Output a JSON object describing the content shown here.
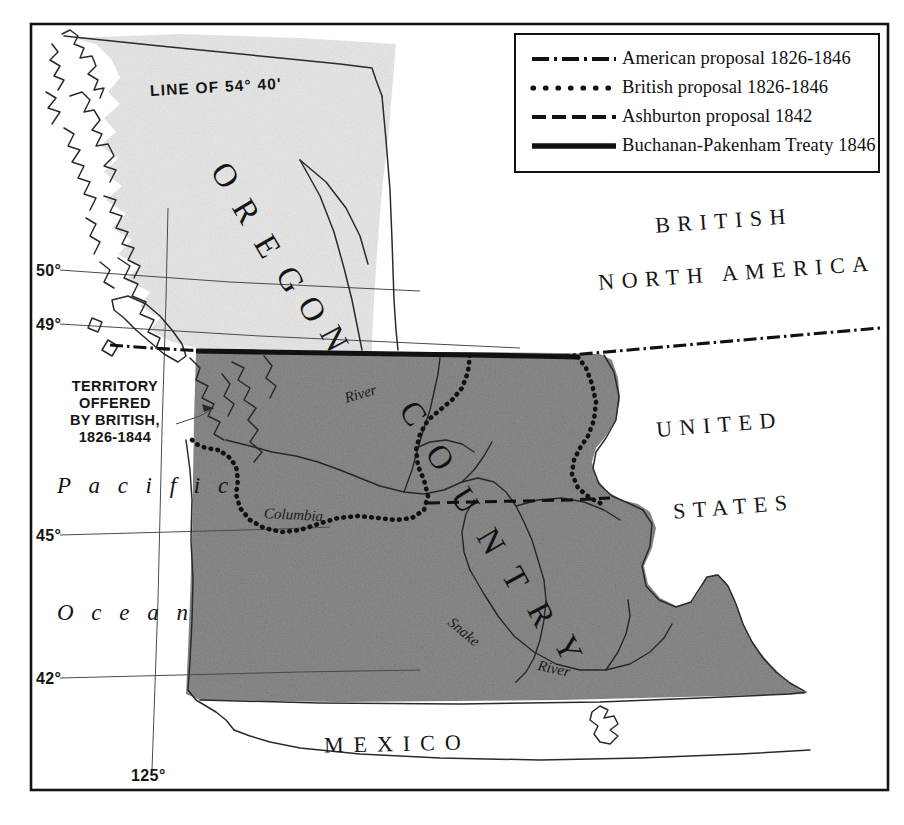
{
  "map": {
    "title_region": "Oregon Country boundary dispute map",
    "legend": {
      "entries": [
        {
          "style": "dash-dot",
          "label": "American proposal 1826-1846"
        },
        {
          "style": "dotted",
          "label": "British proposal 1826-1846"
        },
        {
          "style": "dashed",
          "label": "Ashburton proposal 1842"
        },
        {
          "style": "solid",
          "label": "Buchanan-Pakenham Treaty 1846"
        }
      ]
    },
    "labels": {
      "line_of_5440": "LINE OF 54° 40'",
      "territory_offered": "TERRITORY\nOFFERED\nBY BRITISH,\n1826-1844",
      "territory_offered_lines": [
        "TERRITORY",
        "OFFERED",
        "BY BRITISH,",
        "1826-1844"
      ],
      "pacific": "P a c i f i c",
      "ocean": "O c e a n",
      "british": "BRITISH",
      "north_america": "NORTH AMERICA",
      "united": "UNITED",
      "states": "STATES",
      "mexico": "MEXICO",
      "oregon": "OREGON",
      "country": "COUNTRY",
      "columbia_river_name": "Columbia",
      "columbia_river_word2": "River",
      "snake_river_name": "Snake",
      "snake_river_word2": "River"
    },
    "graticule": {
      "latitudes": [
        "50°",
        "49°",
        "45°",
        "42°"
      ],
      "longitudes": [
        "125°"
      ],
      "lat_50": "50°",
      "lat_49": "49°",
      "lat_45": "45°",
      "lat_42": "42°",
      "lon_125": "125°"
    },
    "colors": {
      "oregon_country_fill": "#8d8d8d",
      "british_territory_fill": "#e7e7e7",
      "ink": "#141414",
      "paper": "#ffffff"
    }
  }
}
